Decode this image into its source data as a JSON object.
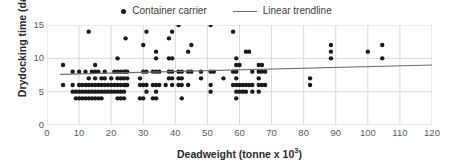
{
  "chart_data": {
    "type": "scatter",
    "title": "",
    "xlabel": "Deadweight (tonne x 10³)",
    "xlabel_base": "Deadweight (tonne x 10",
    "xlabel_sup": "3",
    "xlabel_tail": ")",
    "ylabel": "Drydocking time (day)",
    "xlim": [
      0,
      120
    ],
    "ylim": [
      0,
      15
    ],
    "xticks": [
      0,
      10,
      20,
      30,
      40,
      50,
      60,
      70,
      80,
      90,
      100,
      110,
      120
    ],
    "yticks": [
      0,
      5,
      10,
      15
    ],
    "grid": "both",
    "legend_position": "top-center",
    "legend": [
      {
        "label": "Container carrier",
        "marker": "dot",
        "color": "#1a1a1a"
      },
      {
        "label": "Linear trendline",
        "marker": "line",
        "color": "#6e6e6e"
      }
    ],
    "series": [
      {
        "name": "Container carrier",
        "marker": "circle",
        "color": "#1a1a1a",
        "points": [
          [
            5,
            9
          ],
          [
            5,
            6
          ],
          [
            8,
            8
          ],
          [
            8,
            6
          ],
          [
            8,
            5
          ],
          [
            9,
            5
          ],
          [
            9,
            4
          ],
          [
            10,
            8
          ],
          [
            10,
            6
          ],
          [
            10,
            5
          ],
          [
            10,
            4
          ],
          [
            11,
            6
          ],
          [
            11,
            5
          ],
          [
            11,
            4
          ],
          [
            12,
            8
          ],
          [
            12,
            6
          ],
          [
            12,
            5
          ],
          [
            12,
            4
          ],
          [
            13,
            14
          ],
          [
            13,
            7
          ],
          [
            13,
            6
          ],
          [
            13,
            5
          ],
          [
            13,
            4
          ],
          [
            14,
            8
          ],
          [
            14,
            6
          ],
          [
            14,
            5
          ],
          [
            14,
            4
          ],
          [
            15,
            9
          ],
          [
            15,
            8
          ],
          [
            15,
            7
          ],
          [
            15,
            6
          ],
          [
            15,
            5
          ],
          [
            15,
            4
          ],
          [
            16,
            8
          ],
          [
            16,
            6
          ],
          [
            16,
            5
          ],
          [
            16,
            4
          ],
          [
            17,
            7
          ],
          [
            17,
            6
          ],
          [
            17,
            5
          ],
          [
            17,
            4
          ],
          [
            18,
            8
          ],
          [
            18,
            7
          ],
          [
            18,
            6
          ],
          [
            18,
            5
          ],
          [
            19,
            6
          ],
          [
            19,
            5
          ],
          [
            20,
            7
          ],
          [
            20,
            6
          ],
          [
            20,
            5
          ],
          [
            21,
            8
          ],
          [
            21,
            6
          ],
          [
            21,
            5
          ],
          [
            22,
            10
          ],
          [
            22,
            8
          ],
          [
            22,
            7
          ],
          [
            22,
            6
          ],
          [
            22,
            5
          ],
          [
            22,
            4
          ],
          [
            23,
            8
          ],
          [
            23,
            7
          ],
          [
            23,
            6
          ],
          [
            23,
            5
          ],
          [
            23,
            4
          ],
          [
            24,
            8
          ],
          [
            24,
            7
          ],
          [
            24,
            6
          ],
          [
            24,
            5
          ],
          [
            24,
            4
          ],
          [
            24.5,
            13
          ],
          [
            24.5,
            8
          ],
          [
            24.5,
            6
          ],
          [
            25,
            8
          ],
          [
            25,
            7
          ],
          [
            25,
            6
          ],
          [
            29,
            7
          ],
          [
            29,
            6
          ],
          [
            29,
            4
          ],
          [
            30,
            12
          ],
          [
            30,
            8
          ],
          [
            30,
            6
          ],
          [
            30,
            4
          ],
          [
            31,
            14
          ],
          [
            31,
            8
          ],
          [
            31,
            6
          ],
          [
            31,
            5
          ],
          [
            33,
            8
          ],
          [
            33,
            6
          ],
          [
            33,
            4
          ],
          [
            34,
            11
          ],
          [
            34,
            10
          ],
          [
            34,
            8
          ],
          [
            34,
            6
          ],
          [
            34,
            5
          ],
          [
            34,
            4
          ],
          [
            35,
            8
          ],
          [
            35,
            6
          ],
          [
            37,
            6
          ],
          [
            38,
            13
          ],
          [
            38,
            10
          ],
          [
            38,
            8
          ],
          [
            38,
            7
          ],
          [
            39,
            14
          ],
          [
            39,
            10
          ],
          [
            39,
            8
          ],
          [
            39,
            7
          ],
          [
            39,
            6
          ],
          [
            41,
            15
          ],
          [
            41,
            8
          ],
          [
            41,
            7
          ],
          [
            41,
            6
          ],
          [
            42,
            8
          ],
          [
            42,
            7
          ],
          [
            42,
            6
          ],
          [
            42,
            4
          ],
          [
            44,
            11
          ],
          [
            44,
            8
          ],
          [
            44,
            6
          ],
          [
            45,
            12
          ],
          [
            45,
            8
          ],
          [
            48,
            8
          ],
          [
            48,
            7
          ],
          [
            51,
            15
          ],
          [
            51,
            8
          ],
          [
            51,
            6
          ],
          [
            51,
            5
          ],
          [
            52,
            8
          ],
          [
            55,
            7
          ],
          [
            58,
            14
          ],
          [
            58,
            8
          ],
          [
            58,
            6
          ],
          [
            59,
            10
          ],
          [
            59,
            9
          ],
          [
            59,
            8
          ],
          [
            59,
            7
          ],
          [
            59,
            6
          ],
          [
            59,
            5
          ],
          [
            59,
            4
          ],
          [
            60,
            9
          ],
          [
            60,
            6
          ],
          [
            60,
            5
          ],
          [
            61,
            6
          ],
          [
            61,
            5
          ],
          [
            62,
            11
          ],
          [
            62,
            6
          ],
          [
            62,
            5
          ],
          [
            63,
            11
          ],
          [
            63,
            6
          ],
          [
            64,
            8
          ],
          [
            64,
            6
          ],
          [
            64,
            5
          ],
          [
            66,
            9
          ],
          [
            66,
            8
          ],
          [
            66,
            7
          ],
          [
            66,
            6
          ],
          [
            66,
            5
          ],
          [
            67,
            9
          ],
          [
            67,
            8
          ],
          [
            67,
            6
          ],
          [
            68,
            8
          ],
          [
            68,
            6
          ],
          [
            82,
            7
          ],
          [
            82,
            6
          ],
          [
            88.5,
            12
          ],
          [
            88.5,
            11
          ],
          [
            88.5,
            10
          ],
          [
            100,
            11
          ],
          [
            104.5,
            12
          ],
          [
            104.5,
            10
          ]
        ]
      }
    ],
    "trendline": {
      "name": "Linear trendline",
      "color": "#6e6e6e",
      "x_start": 4,
      "y_start": 7.6,
      "x_end": 120,
      "y_end": 9.0
    }
  }
}
